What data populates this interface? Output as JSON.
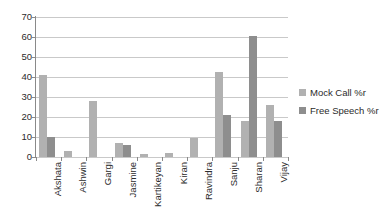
{
  "chart_data": {
    "type": "bar",
    "title": "",
    "xlabel": "",
    "ylabel": "",
    "ylim": [
      0,
      70
    ],
    "ytick_step": 10,
    "yticks": [
      70,
      60,
      50,
      40,
      30,
      20,
      10,
      0
    ],
    "grid": "horizontal",
    "legend_position": "right",
    "categories": [
      "Akshata",
      "Ashwin",
      "Gargi",
      "Jasmine",
      "Kartikeyan",
      "Kiran",
      "Ravindra",
      "Sanju",
      "Sharan",
      "Vijay"
    ],
    "series": [
      {
        "name": "Mock Call %r",
        "color": "#b1b1b1",
        "values": [
          41,
          3,
          28,
          7,
          1.5,
          2,
          9.5,
          42.5,
          18,
          26
        ]
      },
      {
        "name": "Free Speech %r",
        "color": "#8e8e8e",
        "values": [
          10,
          0,
          0,
          6,
          0,
          0,
          0,
          21,
          60.5,
          18
        ]
      }
    ]
  },
  "legend": {
    "items": [
      {
        "label": "Mock Call %r",
        "color": "#b1b1b1"
      },
      {
        "label": "Free Speech %r",
        "color": "#8e8e8e"
      }
    ]
  },
  "axis": {
    "y_labels": [
      "70",
      "60",
      "50",
      "40",
      "30",
      "20",
      "10",
      "0"
    ]
  }
}
